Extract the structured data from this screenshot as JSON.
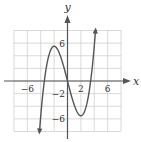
{
  "chart_data": {
    "type": "line",
    "title": "",
    "xlabel": "x",
    "ylabel": "y",
    "xlim": [
      -8,
      8
    ],
    "ylim": [
      -8,
      8
    ],
    "grid": true,
    "grid_step": 2,
    "x_tick_labels": [
      {
        "value": -6,
        "label": "−6"
      },
      {
        "value": 2,
        "label": "2"
      },
      {
        "value": 6,
        "label": "6"
      }
    ],
    "y_tick_labels": [
      {
        "value": 6,
        "label": "6"
      },
      {
        "value": -2,
        "label": "−2"
      },
      {
        "value": -6,
        "label": "−6"
      }
    ],
    "series": [
      {
        "name": "f(x)",
        "kind": "cubic",
        "approx_formula": "0.344x^3 - 4.125x",
        "x_range": [
          -4.2,
          4.2
        ],
        "key_points": [
          {
            "x": -4.2,
            "y": -7.4,
            "note": "left arrow end"
          },
          {
            "x": -3.5,
            "y": 0,
            "note": "zero"
          },
          {
            "x": -2,
            "y": 5.5,
            "note": "local max"
          },
          {
            "x": 0,
            "y": 0,
            "note": "zero"
          },
          {
            "x": 2,
            "y": -5.5,
            "note": "local min"
          },
          {
            "x": 3.5,
            "y": 0,
            "note": "zero"
          },
          {
            "x": 4.2,
            "y": 8,
            "note": "right arrow end"
          }
        ],
        "color": "#555555"
      }
    ]
  },
  "colors": {
    "grid": "#cfcfcf",
    "axis": "#555555",
    "curve": "#555555",
    "text": "#333333"
  }
}
